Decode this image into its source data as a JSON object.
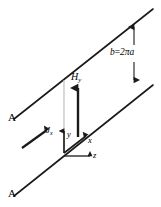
{
  "figure": {
    "background_color": "#ffffff",
    "line_color": "#1a1a1a",
    "guide_color": "#b8b8b8",
    "labels": {
      "sheet_top": "A",
      "sheet_bottom": "A",
      "spacing": "b",
      "spacing_equals": "=",
      "spacing_value": "2πa",
      "field_symbol": "H",
      "field_subscript": "y",
      "current_symbol": "J",
      "current_subscript": "x",
      "axis_x": "x",
      "axis_y": "y",
      "axis_z": "z"
    },
    "icon_names": {
      "spacing_arrow": "double-headed-arrow-icon",
      "field_arrow": "up-arrow-icon",
      "current_arrow": "diagonal-arrow-icon",
      "axis_x_arrow": "diagonal-arrow-icon",
      "axis_y_arrow": "up-arrow-icon",
      "axis_z_arrow": "right-arrow-icon"
    }
  }
}
